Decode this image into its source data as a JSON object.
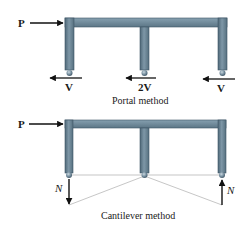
{
  "colors": {
    "frame_fill": "#6f8899",
    "frame_dark": "#4a6272",
    "frame_light": "#93a9b7",
    "arrow": "#111111",
    "thin_line": "#9a9a9a"
  },
  "portal": {
    "load_label": "P",
    "reaction_left": "V",
    "reaction_middle": "2V",
    "reaction_right": "V",
    "caption": "Portal method"
  },
  "cantilever": {
    "load_label": "P",
    "axial_left": "N",
    "axial_right": "N",
    "caption": "Cantilever method"
  }
}
